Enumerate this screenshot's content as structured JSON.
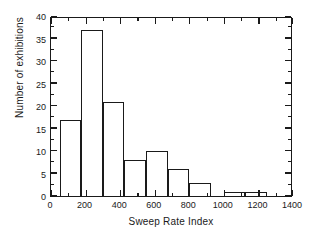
{
  "chart_data": {
    "type": "bar",
    "title": "",
    "subtitle": "",
    "xlabel": "Sweep Rate Index",
    "ylabel": "Number of exhibitions",
    "xlim": [
      0,
      1400
    ],
    "ylim": [
      0,
      40
    ],
    "grid": false,
    "legend": null,
    "bin_width": 125,
    "bin_edges": [
      50,
      175,
      300,
      425,
      550,
      675,
      800,
      925,
      1000,
      1125,
      1250
    ],
    "bins": [
      {
        "label": "50-175",
        "start": 50,
        "end": 175,
        "value": 17
      },
      {
        "label": "175-300",
        "start": 175,
        "end": 300,
        "value": 37
      },
      {
        "label": "300-425",
        "start": 300,
        "end": 425,
        "value": 21
      },
      {
        "label": "425-550",
        "start": 425,
        "end": 550,
        "value": 8
      },
      {
        "label": "550-675",
        "start": 550,
        "end": 675,
        "value": 10
      },
      {
        "label": "675-800",
        "start": 675,
        "end": 800,
        "value": 6
      },
      {
        "label": "800-925",
        "start": 800,
        "end": 925,
        "value": 3
      },
      {
        "label": "1000-1125",
        "start": 1000,
        "end": 1125,
        "value": 1
      },
      {
        "label": "1125-1250",
        "start": 1125,
        "end": 1250,
        "value": 1
      }
    ],
    "categories": [
      "50-175",
      "175-300",
      "300-425",
      "425-550",
      "550-675",
      "675-800",
      "800-925",
      "1000-1125",
      "1125-1250"
    ],
    "values": [
      17,
      37,
      21,
      8,
      10,
      6,
      3,
      1,
      1
    ],
    "xticks": [
      0,
      200,
      400,
      600,
      800,
      1000,
      1200,
      1400
    ],
    "xticklabels": [
      "0",
      "200",
      "400",
      "600",
      "800",
      "1000",
      "1200",
      "1400"
    ],
    "xminorticks": [
      100,
      300,
      500,
      700,
      900,
      1100,
      1300
    ],
    "yticks": [
      0,
      5,
      10,
      15,
      20,
      25,
      30,
      35,
      40
    ],
    "yticklabels": [
      "0",
      "5",
      "10",
      "15",
      "20",
      "25",
      "30",
      "35",
      "40"
    ],
    "yminorticks": [
      2.5,
      7.5,
      12.5,
      17.5,
      22.5,
      27.5,
      32.5,
      37.5
    ],
    "colors": {
      "bar_edge": "#1a1a1a",
      "bar_fill": "transparent",
      "axis": "#1a1a1a",
      "background": "#ffffff",
      "text": "#1a1a1a"
    }
  }
}
